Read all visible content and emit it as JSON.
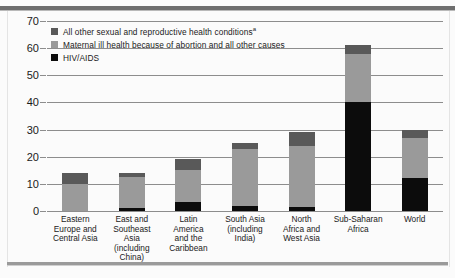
{
  "chart_data": {
    "type": "bar",
    "subtype": "stacked-bar",
    "title": "",
    "xlabel": "",
    "ylabel": "",
    "ylim": [
      0,
      70
    ],
    "yticks": [
      0,
      10,
      20,
      30,
      40,
      50,
      60,
      70
    ],
    "ytick_labels": [
      "0",
      "10",
      "20",
      "30",
      "40",
      "50",
      "60",
      "70"
    ],
    "grid": true,
    "grid_axis": "y",
    "legend_position": "top-left",
    "categories": [
      "Eastern Europe and Central Asia",
      "East and Southeast Asia (including China)",
      "Latin America and the Caribbean",
      "South Asia (including India)",
      "North Africa and West Asia",
      "Sub-Saharan Africa",
      "World"
    ],
    "category_lines": [
      [
        "Eastern",
        "Europe and",
        "Central Asia"
      ],
      [
        "East and",
        "Southeast",
        "Asia",
        "(including",
        "China)"
      ],
      [
        "Latin",
        "America",
        "and the",
        "Caribbean"
      ],
      [
        "South Asia",
        "(including",
        "India)"
      ],
      [
        "North",
        "Africa and",
        "West Asia"
      ],
      [
        "Sub-Saharan",
        "Africa"
      ],
      [
        "World"
      ]
    ],
    "series": [
      {
        "name": "HIV/AIDS",
        "color": "#0c0c0c",
        "values": [
          0,
          1,
          3.5,
          2,
          1.5,
          40,
          12
        ]
      },
      {
        "name": "Maternal ill health because of abortion and all other causes",
        "color": "#9a9a9a",
        "values": [
          10,
          11.5,
          11.5,
          21,
          22.5,
          18,
          15
        ]
      },
      {
        "name": "All other sexual and reproductive health conditions",
        "color": "#595959",
        "values": [
          4,
          1.5,
          4,
          2,
          5,
          3,
          3
        ]
      }
    ],
    "totals": [
      14,
      14,
      19,
      25,
      29,
      61,
      30
    ],
    "legend": [
      {
        "label": "All other sexual and reproductive health conditions",
        "superscript": "a",
        "color": "#595959"
      },
      {
        "label": "Maternal ill health because of abortion and all other causes",
        "superscript": "",
        "color": "#9a9a9a"
      },
      {
        "label": "HIV/AIDS",
        "superscript": "",
        "color": "#0c0c0c"
      }
    ]
  }
}
